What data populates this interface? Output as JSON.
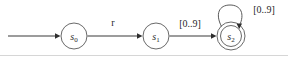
{
  "diagram": {
    "canvas": {
      "width": 288,
      "height": 57,
      "background": "#ffffff"
    },
    "stroke_color": "#5a5a5a",
    "text_color": "#1f1f1f"
  },
  "states": [
    {
      "id": "s0",
      "name": "s",
      "subscript": "0",
      "kind": "start",
      "accepting": false,
      "cx": 74,
      "cy": 36,
      "r": 13
    },
    {
      "id": "s1",
      "name": "s",
      "subscript": "1",
      "kind": "normal",
      "accepting": false,
      "cx": 156,
      "cy": 36,
      "r": 13
    },
    {
      "id": "s2",
      "name": "s",
      "subscript": "2",
      "kind": "accepting",
      "accepting": true,
      "cx": 231,
      "cy": 36,
      "r": 14,
      "r_inner": 10.5
    }
  ],
  "transitions": [
    {
      "id": "start-arrow",
      "from": "",
      "to": "s0",
      "label": "",
      "kind": "initial"
    },
    {
      "id": "s0-to-s1",
      "from": "s0",
      "to": "s1",
      "label": "r",
      "label_x": 113,
      "label_y": 26,
      "kind": "straight"
    },
    {
      "id": "s1-to-s2",
      "from": "s1",
      "to": "s2",
      "label": "[0..9]",
      "label_x": 190,
      "label_y": 27,
      "kind": "straight"
    },
    {
      "id": "s2-self-loop",
      "from": "s2",
      "to": "s2",
      "label": "[0..9]",
      "label_x": 264,
      "label_y": 13,
      "kind": "self-loop"
    }
  ]
}
